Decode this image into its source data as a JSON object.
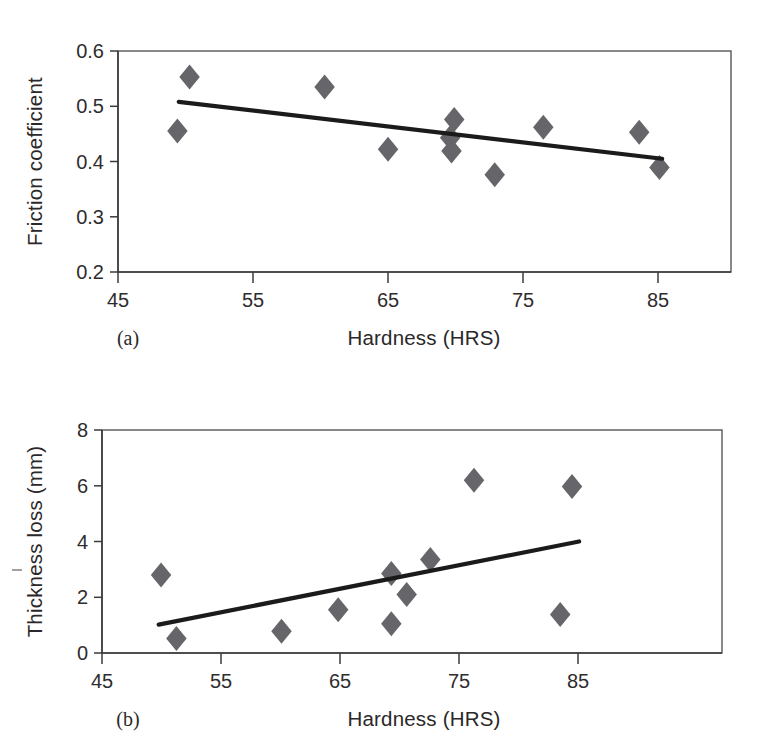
{
  "figure": {
    "background": "#ffffff",
    "marker_color": "#666569",
    "line_color": "#1b1b1b",
    "axis_color": "#3b3b3b"
  },
  "panels": [
    {
      "tag": "(a)",
      "xlabel": "Hardness (HRS)",
      "ylabel": "Friction coefficient",
      "xticks": [
        "45",
        "55",
        "65",
        "75",
        "85"
      ],
      "yticks": [
        "0.2",
        "0.3",
        "0.4",
        "0.5",
        "0.6"
      ]
    },
    {
      "tag": "(b)",
      "xlabel": "Hardness (HRS)",
      "ylabel": "Thickness loss (mm)",
      "xticks": [
        "45",
        "55",
        "65",
        "75",
        "85"
      ],
      "yticks": [
        "0",
        "2",
        "4",
        "6",
        "8"
      ]
    }
  ],
  "chart_data": [
    {
      "type": "scatter",
      "panel": "(a)",
      "title": "",
      "xlabel": "Hardness (HRS)",
      "ylabel": "Friction coefficient",
      "xlim": [
        45,
        90.4
      ],
      "ylim": [
        0.2,
        0.6
      ],
      "xticks": [
        45,
        55,
        65,
        75,
        85
      ],
      "yticks": [
        0.2,
        0.3,
        0.4,
        0.5,
        0.6
      ],
      "grid": false,
      "legend": null,
      "points": [
        {
          "x": 50.3,
          "y": 0.553
        },
        {
          "x": 49.4,
          "y": 0.455
        },
        {
          "x": 60.3,
          "y": 0.535
        },
        {
          "x": 65.0,
          "y": 0.422
        },
        {
          "x": 69.9,
          "y": 0.476
        },
        {
          "x": 69.6,
          "y": 0.443
        },
        {
          "x": 69.7,
          "y": 0.419
        },
        {
          "x": 72.9,
          "y": 0.376
        },
        {
          "x": 76.5,
          "y": 0.462
        },
        {
          "x": 83.6,
          "y": 0.453
        },
        {
          "x": 85.1,
          "y": 0.389
        }
      ],
      "trendline": {
        "x": [
          49.5,
          85.3
        ],
        "y": [
          0.508,
          0.405
        ]
      }
    },
    {
      "type": "scatter",
      "panel": "(b)",
      "title": "",
      "xlabel": "Hardness (HRS)",
      "ylabel": "Thickness loss (mm)",
      "xlim": [
        45,
        97.5
      ],
      "ylim": [
        0,
        8
      ],
      "xticks": [
        45,
        55,
        65,
        75,
        85
      ],
      "yticks": [
        0,
        2,
        4,
        6,
        8
      ],
      "grid": false,
      "legend": null,
      "points": [
        {
          "x": 50.0,
          "y": 2.8
        },
        {
          "x": 51.3,
          "y": 0.52
        },
        {
          "x": 60.2,
          "y": 0.78
        },
        {
          "x": 65.0,
          "y": 1.55
        },
        {
          "x": 69.5,
          "y": 2.85
        },
        {
          "x": 69.5,
          "y": 1.05
        },
        {
          "x": 70.8,
          "y": 2.1
        },
        {
          "x": 72.8,
          "y": 3.35
        },
        {
          "x": 76.5,
          "y": 6.2
        },
        {
          "x": 83.8,
          "y": 1.38
        },
        {
          "x": 84.8,
          "y": 5.97
        }
      ],
      "trendline": {
        "x": [
          49.8,
          85.4
        ],
        "y": [
          1.02,
          4.0
        ]
      }
    }
  ]
}
